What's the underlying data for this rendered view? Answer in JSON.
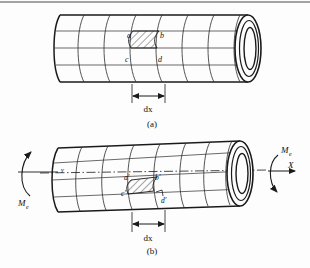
{
  "figure": {
    "title_caption_a": "(a)",
    "title_caption_b": "(b)",
    "background_color": "#fdfdfd",
    "line_color": "#1a1a1a",
    "hatch_color": "#3a3a3a"
  },
  "panel_a": {
    "caption": "(a)",
    "description": "undeformed hollow circular shaft with longitudinal and circumferential grid lines",
    "corner_labels": [
      "a",
      "b",
      "c",
      "d"
    ],
    "dimension_label": "dx",
    "grid": {
      "circumferential_lines": 8,
      "longitudinal_lines": 4
    }
  },
  "panel_b": {
    "caption": "(b)",
    "description": "shaft twisted by external torque, longitudinal lines become helices",
    "corner_labels": [
      "a'",
      "b'",
      "c'",
      "d'"
    ],
    "dimension_label": "dx",
    "shear_angle_label": "γ",
    "torque_label_left": "M",
    "torque_sub_left": "e",
    "torque_label_right": "M",
    "torque_sub_right": "e",
    "axis_label": "X",
    "grid": {
      "circumferential_lines": 8,
      "helical_lines": 4
    }
  }
}
